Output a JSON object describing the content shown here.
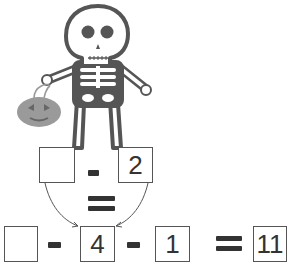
{
  "illustration": {
    "subject": "skeleton-holding-pumpkin-bucket",
    "colors": {
      "outline": "#555555",
      "bone": "#ffffff",
      "pumpkin": "#9a9a9a"
    }
  },
  "top_equation": {
    "boxes": [
      "",
      "2"
    ],
    "operator": "-",
    "relation": "="
  },
  "bottom_equation": {
    "boxes": [
      "",
      "4",
      "1",
      "11"
    ],
    "operators": [
      "-",
      "-"
    ],
    "relation": "="
  }
}
